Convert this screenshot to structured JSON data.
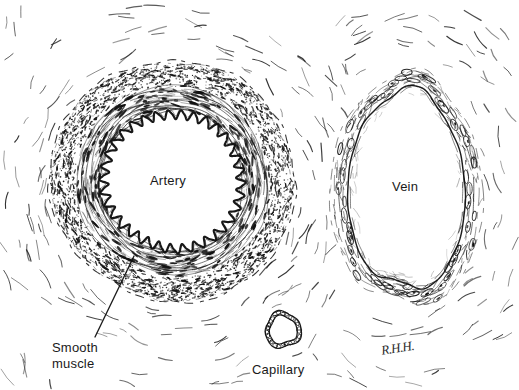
{
  "figure": {
    "background_color": "#ffffff",
    "ink_color": "#111111",
    "width": 519,
    "height": 390
  },
  "labels": {
    "artery": "Artery",
    "vein": "Vein",
    "capillary": "Capillary",
    "smooth_muscle_line1": "Smooth",
    "smooth_muscle_line2": "muscle",
    "signature": "R.H.H."
  },
  "structures": {
    "artery": {
      "name": "Artery",
      "center_x": 173,
      "center_y": 181,
      "outer_radius": 122,
      "lumen_radius": 68,
      "wall_layers": [
        "adventitia-stipple",
        "media-concentric",
        "internal-elastic-lamina-crenated"
      ],
      "lumen_border_style": "wavy"
    },
    "vein": {
      "name": "Vein",
      "center_x": 407,
      "center_y": 190,
      "radius_x": 73,
      "radius_y": 121,
      "wall_thickness": 17,
      "wall_layers": [
        "thin-wall-endothelium",
        "flattened-nuclei"
      ],
      "lumen_border_style": "irregular-oval"
    },
    "capillary": {
      "name": "Capillary",
      "center_x": 283,
      "center_y": 330,
      "radius": 18,
      "wall_layers": [
        "single-endothelial-cell-ring"
      ],
      "lumen_border_style": "linked-cells"
    }
  },
  "leader_line": {
    "name": "smooth-muscle-leader",
    "from_x": 95,
    "from_y": 337,
    "to_x": 134,
    "to_y": 256
  }
}
